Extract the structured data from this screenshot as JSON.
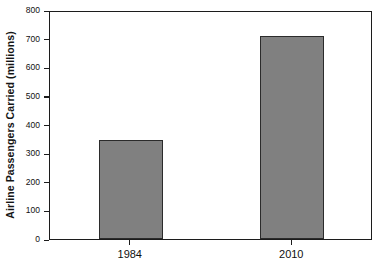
{
  "chart_data": {
    "type": "bar",
    "title": "",
    "xlabel": "",
    "ylabel": "Airline Passengers Carried (millions)",
    "categories": [
      "1984",
      "2010"
    ],
    "values": [
      345,
      710
    ],
    "series": [
      {
        "name": "Airline Passengers Carried (millions)",
        "values": [
          345,
          710
        ]
      }
    ],
    "ylim": [
      0,
      800
    ],
    "yticks": [
      0,
      100,
      200,
      300,
      400,
      500,
      600,
      700,
      800
    ],
    "ytick_labels": [
      "0",
      "100",
      "200",
      "300",
      "400",
      "500",
      "600",
      "700",
      "800"
    ],
    "grid": false,
    "legend": false,
    "bar_color": "#808080",
    "bar_edge_color": "#2b2b2b",
    "axis_color": "#1c1c1c",
    "background_color": "#ffffff"
  }
}
